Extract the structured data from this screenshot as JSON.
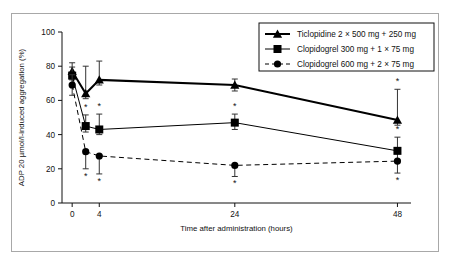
{
  "figure": {
    "background": "#ffffff",
    "border_color": "#a8a8a8"
  },
  "chart_data": {
    "type": "line",
    "title": "",
    "xlabel": "Time after administration (hours)",
    "ylabel": "ADP 20 µmol/l-induced aggregation (%)",
    "xlim": [
      -1.5,
      50
    ],
    "ylim": [
      0,
      100
    ],
    "xticks": [
      0,
      4,
      24,
      48
    ],
    "xtick_labels": [
      "0",
      "4",
      "24",
      "48"
    ],
    "yticks": [
      0,
      20,
      40,
      60,
      80,
      100
    ],
    "ytick_labels": [
      "0",
      "20",
      "40",
      "60",
      "80",
      "100"
    ],
    "grid": false,
    "legend_position": "top-right",
    "error_bars": "standard deviation",
    "significance_marker": "*",
    "series": [
      {
        "name": "Ticlopidine 2 × 500 mg + 250 mg",
        "marker": "triangle",
        "linestyle": "solid",
        "linewidth": 2.0,
        "color": "#000000",
        "x": [
          0,
          2,
          4,
          24,
          48
        ],
        "values": [
          77,
          64,
          72,
          69,
          48.5
        ],
        "err_up": [
          5,
          16,
          11,
          3.5,
          18
        ],
        "err_down": [
          5,
          3,
          3,
          3.5,
          3
        ],
        "star": [
          null,
          null,
          null,
          null,
          "above"
        ]
      },
      {
        "name": "Clopidogrel 300 mg + 1 × 75 mg",
        "marker": "square",
        "linestyle": "solid",
        "linewidth": 1.0,
        "color": "#000000",
        "x": [
          0,
          2,
          4,
          24,
          48
        ],
        "values": [
          74.5,
          45,
          43,
          47,
          30.5
        ],
        "err_up": [
          5,
          6.5,
          9,
          5,
          8
        ],
        "err_down": [
          5,
          3.5,
          3,
          4,
          7
        ],
        "star": [
          null,
          "above",
          "above",
          "above",
          "above"
        ]
      },
      {
        "name": "Clopidogrel 600 mg + 2 × 75 mg",
        "marker": "circle",
        "linestyle": "dashed",
        "linewidth": 1.0,
        "color": "#000000",
        "x": [
          0,
          2,
          4,
          24,
          48
        ],
        "values": [
          69,
          30,
          27.5,
          22,
          24.5
        ],
        "err_up": [
          6,
          0,
          0,
          0,
          0
        ],
        "err_down": [
          6,
          10,
          10.5,
          6.5,
          7
        ],
        "star": [
          null,
          "below",
          "below",
          "below",
          "below"
        ]
      }
    ]
  },
  "legend": {
    "items": [
      {
        "label": "Ticlopidine 2 × 500 mg + 250 mg",
        "marker": "triangle",
        "linestyle": "solid"
      },
      {
        "label": "Clopidogrel 300 mg + 1 × 75 mg",
        "marker": "square",
        "linestyle": "solid"
      },
      {
        "label": "Clopidogrel 600 mg + 2 × 75 mg",
        "marker": "circle",
        "linestyle": "dashed"
      }
    ]
  }
}
